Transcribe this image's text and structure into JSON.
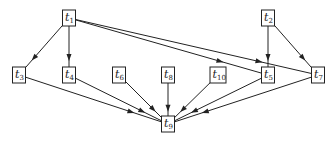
{
  "diagram": {
    "type": "directed-graph",
    "colors": {
      "stroke": "#222222",
      "background": "#ffffff"
    },
    "nodes": [
      {
        "id": "t1",
        "base": "t",
        "sub": "1",
        "x": 69,
        "y": 18
      },
      {
        "id": "t2",
        "base": "t",
        "sub": "2",
        "x": 268,
        "y": 18
      },
      {
        "id": "t3",
        "base": "t",
        "sub": "3",
        "x": 19,
        "y": 75
      },
      {
        "id": "t4",
        "base": "t",
        "sub": "4",
        "x": 69,
        "y": 75
      },
      {
        "id": "t6",
        "base": "t",
        "sub": "6",
        "x": 119,
        "y": 75
      },
      {
        "id": "t8",
        "base": "t",
        "sub": "8",
        "x": 168,
        "y": 75
      },
      {
        "id": "t10",
        "base": "t",
        "sub": "10",
        "x": 218,
        "y": 75
      },
      {
        "id": "t5",
        "base": "t",
        "sub": "5",
        "x": 268,
        "y": 75
      },
      {
        "id": "t7",
        "base": "t",
        "sub": "7",
        "x": 318,
        "y": 75
      },
      {
        "id": "t9",
        "base": "t",
        "sub": "9",
        "x": 168,
        "y": 124
      }
    ],
    "edges": [
      {
        "from": "t1",
        "to": "t3"
      },
      {
        "from": "t1",
        "to": "t4"
      },
      {
        "from": "t1",
        "to": "t5"
      },
      {
        "from": "t1",
        "to": "t7"
      },
      {
        "from": "t2",
        "to": "t5"
      },
      {
        "from": "t2",
        "to": "t7"
      },
      {
        "from": "t3",
        "to": "t9"
      },
      {
        "from": "t4",
        "to": "t9"
      },
      {
        "from": "t6",
        "to": "t9"
      },
      {
        "from": "t8",
        "to": "t9"
      },
      {
        "from": "t10",
        "to": "t9"
      },
      {
        "from": "t5",
        "to": "t9"
      },
      {
        "from": "t7",
        "to": "t9"
      }
    ]
  }
}
